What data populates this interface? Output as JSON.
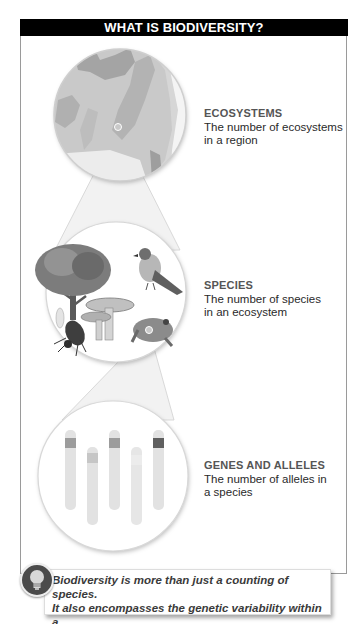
{
  "header": {
    "title": "WHAT IS BIODIVERSITY?"
  },
  "levels": [
    {
      "heading": "ECOSYSTEMS",
      "line1": "The number of ecosystems",
      "line2": "in a region",
      "illustration": "map-of-eastern-us-ecoregions"
    },
    {
      "heading": "SPECIES",
      "line1": "The number of species",
      "line2": "in an ecosystem",
      "illustration": "tree-bird-mushroom-fly-frog"
    },
    {
      "heading": "GENES AND ALLELES",
      "line1": "The number of alleles in",
      "line2": "a species",
      "illustration": "chromosomes-with-allele-bands"
    }
  ],
  "callout": {
    "icon": "lightbulb-icon",
    "line1": "Biodiversity is more than just a counting of species.",
    "line2": "It also encompasses the genetic variability within a",
    "line3": "species, and the variety of ecosystems on earth."
  },
  "colors": {
    "title_bg": "#000000",
    "title_text": "#ffffff",
    "frame": "#9a9a9a",
    "body_text": "#2a2a2a",
    "heading_text": "#555555"
  }
}
